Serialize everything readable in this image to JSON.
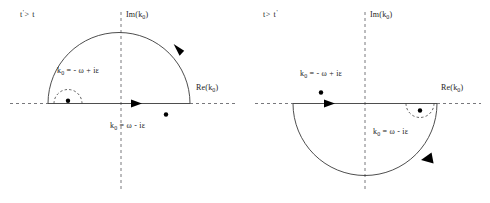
{
  "figure": {
    "type": "contour-integration-diagram-pair",
    "background": "#ffffff",
    "line_color": "#3a3a3a",
    "axis_color": "#55555a",
    "pole_color": "#000000"
  },
  "panels": [
    {
      "id": "left",
      "time_condition_pre": "t",
      "time_condition_prime": "'",
      "time_condition_op": "> t",
      "time_condition_full": "t' > t",
      "imaginary_axis_label_pre": "Im(k",
      "imaginary_axis_label_sub": "0",
      "imaginary_axis_label_post": ")",
      "real_axis_label_pre": "Re(k",
      "real_axis_label_sub": "0",
      "real_axis_label_post": ")",
      "contour_half": "upper",
      "contour_direction": "counterclockwise",
      "poles": [
        {
          "name": "left-pole",
          "label_pre": "k",
          "label_sub": "0",
          "label_post": " =  - ω + iε",
          "label_full": "k0 = -ω + iε",
          "position": "upper-left",
          "enclosed": true,
          "indented": true
        },
        {
          "name": "right-pole",
          "label_pre": "k",
          "label_sub": "0",
          "label_post": " = ω - iε",
          "label_full": "k0 = ω - iε",
          "position": "lower-right",
          "enclosed": false,
          "indented": false
        }
      ]
    },
    {
      "id": "right",
      "time_condition_pre": "t",
      "time_condition_prime": "'",
      "time_condition_op": "> t",
      "time_condition_full": "t > t'",
      "imaginary_axis_label_pre": "Im(k",
      "imaginary_axis_label_sub": "0",
      "imaginary_axis_label_post": ")",
      "real_axis_label_pre": "Re(k",
      "real_axis_label_sub": "0",
      "real_axis_label_post": ")",
      "contour_half": "lower",
      "contour_direction": "clockwise",
      "poles": [
        {
          "name": "left-pole",
          "label_pre": "k",
          "label_sub": "0",
          "label_post": " =  - ω + iε",
          "label_full": "k0 = -ω + iε",
          "position": "upper-left",
          "enclosed": false,
          "indented": false
        },
        {
          "name": "right-pole",
          "label_pre": "k",
          "label_sub": "0",
          "label_post": " = ω - iε",
          "label_full": "k0 = ω - iε",
          "position": "lower-right",
          "enclosed": true,
          "indented": true
        }
      ]
    }
  ]
}
